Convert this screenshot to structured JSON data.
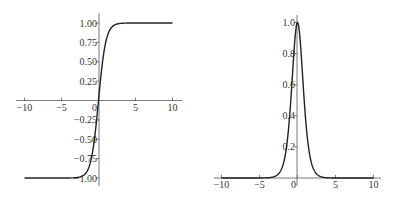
{
  "chart_data": [
    {
      "type": "line",
      "title": "",
      "function": "tanh(x)",
      "xlabel": "",
      "ylabel": "",
      "xlim": [
        -10,
        10
      ],
      "ylim": [
        -1,
        1
      ],
      "grid": false,
      "x_ticks": [
        -10,
        -5,
        0,
        5,
        10
      ],
      "x_tick_labels": [
        "-10",
        "-5",
        "0",
        "5",
        "10"
      ],
      "y_ticks": [
        1.0,
        0.75,
        0.5,
        0.25,
        -0.25,
        -0.5,
        -0.75,
        -1.0
      ],
      "y_tick_labels": [
        "1.00",
        "0.75",
        "0.50",
        "0.25",
        "-0.25",
        "-0.50",
        "-0.75",
        "-1.00"
      ],
      "series": [
        {
          "name": "tanh",
          "x": [
            -10,
            -5,
            -3,
            -2,
            -1.5,
            -1,
            -0.5,
            0,
            0.5,
            1,
            1.5,
            2,
            3,
            5,
            10
          ],
          "values": [
            -1.0,
            -1.0,
            -0.995,
            -0.964,
            -0.905,
            -0.762,
            -0.462,
            0.0,
            0.462,
            0.762,
            0.905,
            0.964,
            0.995,
            1.0,
            1.0
          ]
        }
      ]
    },
    {
      "type": "line",
      "title": "",
      "function": "sech^2(x)",
      "xlabel": "",
      "ylabel": "",
      "xlim": [
        -10,
        10
      ],
      "ylim": [
        0,
        1
      ],
      "grid": false,
      "x_ticks": [
        -10,
        -5,
        0,
        5,
        10
      ],
      "x_tick_labels": [
        "-10",
        "-5",
        "0",
        "5",
        "10"
      ],
      "y_ticks": [
        1.0,
        0.8,
        0.6,
        0.4,
        0.2
      ],
      "y_tick_labels": [
        "1.0",
        "0.8",
        "0.6",
        "0.4",
        "0.2"
      ],
      "series": [
        {
          "name": "sech^2",
          "x": [
            -10,
            -5,
            -3,
            -2,
            -1.5,
            -1,
            -0.5,
            0,
            0.5,
            1,
            1.5,
            2,
            3,
            5,
            10
          ],
          "values": [
            0.0,
            0.0002,
            0.0099,
            0.0707,
            0.1807,
            0.42,
            0.7864,
            1.0,
            0.7864,
            0.42,
            0.1807,
            0.0707,
            0.0099,
            0.0002,
            0.0
          ]
        }
      ]
    }
  ]
}
